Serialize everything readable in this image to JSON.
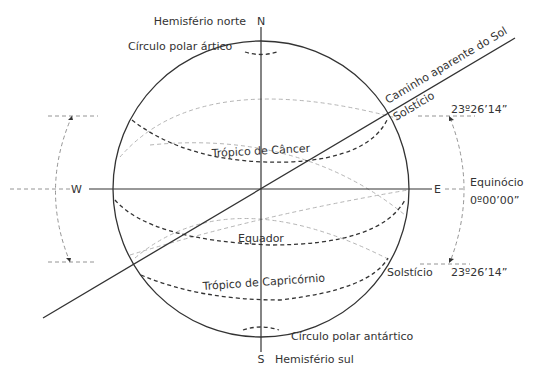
{
  "diagram": {
    "type": "celestial-sphere",
    "labels": {
      "north_hemisphere": "Hemisfério norte",
      "north": "N",
      "south_hemisphere": "Hemisfério sul",
      "south": "S",
      "west": "W",
      "east": "E",
      "arctic_circle": "Círculo polar ártico",
      "antarctic_circle": "Círculo polar antártico",
      "tropic_cancer": "Trópico de Câncer",
      "tropic_capricorn": "Trópico de Capricórnio",
      "equator": "Equador",
      "ecliptic": "Caminho aparente do Sol",
      "solstice_top": "Solstício",
      "solstice_bottom": "Solstício",
      "equinox": "Equinócio",
      "angle_top": "23º26’14”",
      "angle_equinox": "0º00’00”",
      "angle_bottom": "23º26’14”"
    },
    "colors": {
      "line": "#333333",
      "back_dash": "#b5b5b5",
      "guide": "#888888"
    }
  }
}
